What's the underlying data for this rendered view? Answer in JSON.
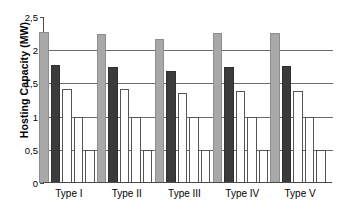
{
  "chart_data": {
    "type": "bar",
    "title": "",
    "xlabel": "",
    "ylabel": "Hosting Capacity (MW)",
    "ylim": [
      0,
      2.5
    ],
    "yticks": [
      0,
      0.5,
      1,
      1.5,
      2,
      2.5
    ],
    "ytick_labels": [
      "0",
      "0,5",
      "1",
      "1,5",
      "2",
      "2,5"
    ],
    "grid": true,
    "legend": "none",
    "categories": [
      "Type I",
      "Type II",
      "Type III",
      "Type IV",
      "Type V"
    ],
    "series": [
      {
        "name": "series-1",
        "color": "#a8a8a8",
        "values": [
          2.28,
          2.25,
          2.17,
          2.26,
          2.26
        ]
      },
      {
        "name": "series-2",
        "color": "#3b3b3b",
        "values": [
          1.77,
          1.75,
          1.68,
          1.75,
          1.76
        ]
      },
      {
        "name": "series-3",
        "color": "#ffffff",
        "values": [
          1.42,
          1.41,
          1.36,
          1.39,
          1.38
        ]
      },
      {
        "name": "series-4",
        "color": "#ffffff",
        "values": [
          1.0,
          1.0,
          1.0,
          1.0,
          1.0
        ]
      },
      {
        "name": "series-5",
        "color": "#ffffff",
        "values": [
          0.5,
          0.5,
          0.5,
          0.5,
          0.5
        ]
      }
    ]
  }
}
